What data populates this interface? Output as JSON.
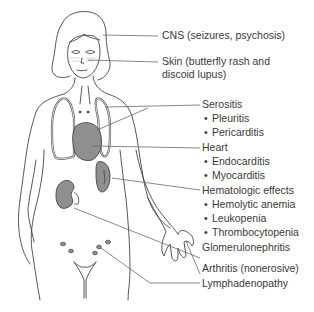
{
  "figure": {
    "organ_fill": "#8f8f8f",
    "line_color": "#444444",
    "leader_color": "#6a6a6a"
  },
  "labels": {
    "cns": "CNS (seizures, psychosis)",
    "skin_line1": "Skin (butterfly rash and",
    "skin_line2": "discoid lupus)",
    "serositis": {
      "title": "Serositis",
      "items": [
        "Pleuritis",
        "Pericarditis"
      ]
    },
    "heart": {
      "title": "Heart",
      "items": [
        "Endocarditis",
        "Myocarditis"
      ]
    },
    "hematologic": {
      "title": "Hematologic effects",
      "items": [
        "Hemolytic anemia",
        "Leukopenia",
        "Thrombocytopenia"
      ]
    },
    "glomerulonephritis": "Glomerulonephritis",
    "arthritis": "Arthritis (nonerosive)",
    "lymphadenopathy": "Lymphadenopathy"
  }
}
